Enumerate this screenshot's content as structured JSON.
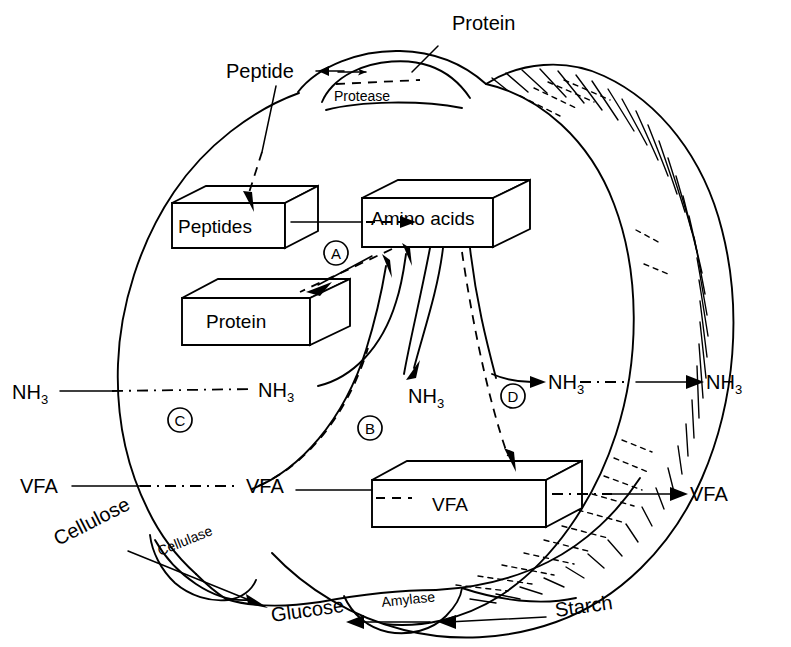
{
  "figure": {
    "type": "biological-process-diagram"
  },
  "labels": {
    "protein_outer": "Protein",
    "peptide_outer": "Peptide",
    "protease": "Protease",
    "peptides_box": "Peptides",
    "amino_acids_box": "Amino acids",
    "protein_box": "Protein",
    "vfa_box": "VFA",
    "nh3_outer_left": "NH",
    "nh3_inner_left": "NH",
    "nh3_center": "NH",
    "nh3_right_inner": "NH",
    "nh3_outer_right": "NH",
    "nh3_sub": "3",
    "vfa_outer_left": "VFA",
    "vfa_inner_left": "VFA",
    "vfa_outer_right": "VFA",
    "cellulose": "Cellulose",
    "cellulase": "Cellulase",
    "glucose": "Glucose",
    "amylase": "Amylase",
    "starch": "Starch"
  },
  "markers": {
    "a": "A",
    "b": "B",
    "c": "C",
    "d": "D"
  },
  "colors": {
    "ink": "#000000",
    "paper": "#ffffff"
  }
}
